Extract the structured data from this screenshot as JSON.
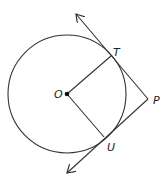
{
  "diagram": {
    "type": "geometry",
    "stroke_color": "#333333",
    "circle": {
      "center_label": "O",
      "cx": 67,
      "cy": 94,
      "r": 59
    },
    "points": {
      "O": {
        "label": "O",
        "x": 67,
        "y": 94
      },
      "T": {
        "label": "T",
        "x": 111,
        "y": 56
      },
      "U": {
        "label": "U",
        "x": 104,
        "y": 137
      },
      "P": {
        "label": "P",
        "x": 148,
        "y": 99
      }
    },
    "segments": [
      {
        "from": "O",
        "to": "T"
      },
      {
        "from": "O",
        "to": "U"
      }
    ],
    "rays": [
      {
        "name": "tangent-PT",
        "from": "P",
        "through": "T",
        "arrow_tip": [
          76,
          14
        ]
      },
      {
        "name": "tangent-PU",
        "from": "P",
        "through": "U",
        "arrow_tip": [
          67,
          173
        ]
      }
    ]
  }
}
